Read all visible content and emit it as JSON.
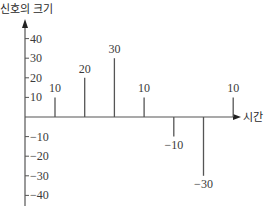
{
  "chart_data": {
    "type": "bar",
    "subtype": "stem",
    "title": "",
    "ylabel": "신호의 크기",
    "xlabel": "시간",
    "ylim": [
      -40,
      40
    ],
    "yticks": [
      40,
      30,
      20,
      10,
      -10,
      -20,
      -30,
      -40
    ],
    "ytick_labels": [
      "40",
      "30",
      "20",
      "10",
      "−10",
      "−20",
      "−30",
      "−40"
    ],
    "x": [
      1,
      2,
      3,
      4,
      5,
      6,
      7
    ],
    "values": [
      10,
      20,
      30,
      10,
      -10,
      -30,
      10
    ],
    "data_labels": [
      "10",
      "20",
      "30",
      "10",
      "−10",
      "−30",
      "10"
    ],
    "grid": false,
    "legend": null
  },
  "colors": {
    "axis": "#555555",
    "stem": "#555555",
    "text": "#333333"
  }
}
